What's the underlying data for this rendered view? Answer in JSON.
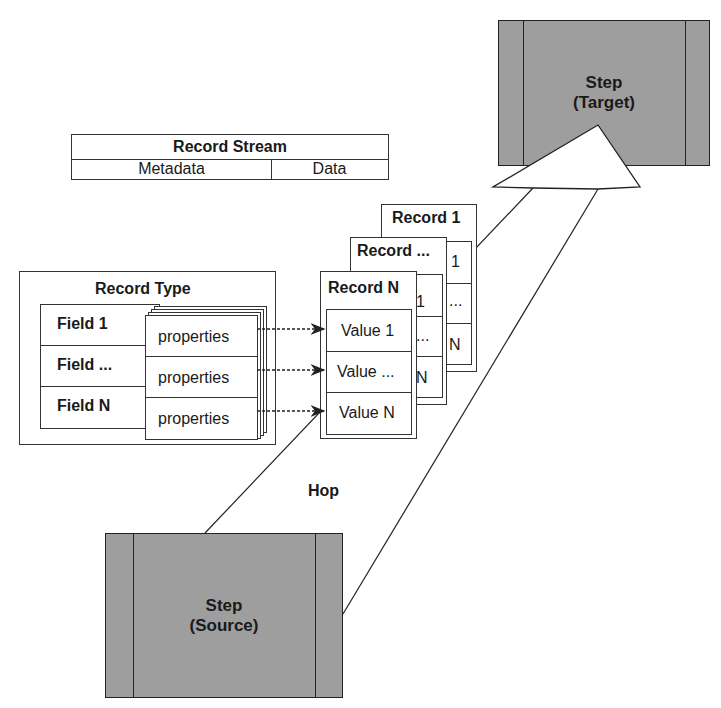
{
  "diagram": {
    "record_stream": {
      "title": "Record Stream",
      "columns": [
        "Metadata",
        "Data"
      ]
    },
    "record_type": {
      "title": "Record Type",
      "fields": [
        "Field 1",
        "Field ...",
        "Field N"
      ],
      "properties": [
        "properties",
        "properties",
        "properties"
      ]
    },
    "records": [
      {
        "title": "Record 1",
        "values": [
          "1",
          "...",
          "N"
        ]
      },
      {
        "title": "Record ...",
        "values": [
          "1",
          "...",
          "N"
        ]
      },
      {
        "title": "Record N",
        "values": [
          "Value 1",
          "Value ...",
          "Value N"
        ]
      }
    ],
    "target_step": {
      "line1": "Step",
      "line2": "(Target)"
    },
    "source_step": {
      "line1": "Step",
      "line2": "(Source)"
    },
    "hop_label": "Hop",
    "colors": {
      "step_fill": "#9e9e9e",
      "line": "#222222",
      "background": "#ffffff"
    }
  }
}
